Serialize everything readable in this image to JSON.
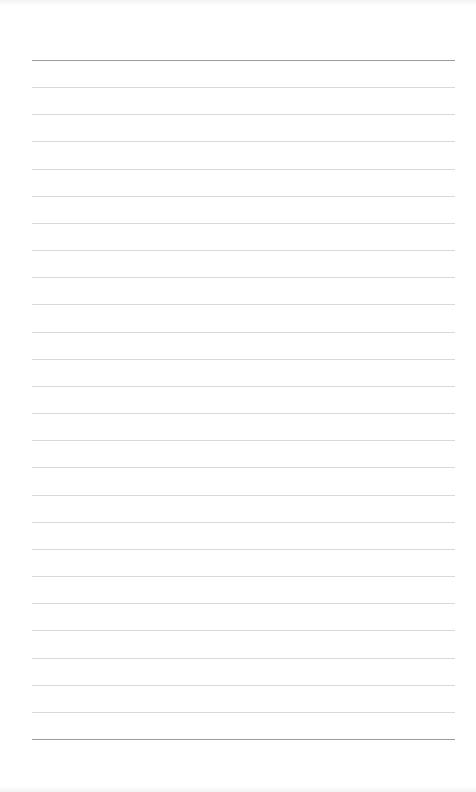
{
  "page": {
    "type": "lined-notebook-paper",
    "line_count": 26,
    "colors": {
      "background": "#ffffff",
      "edge_line": "#9c9c9c",
      "inner_line": "#d9d9d9"
    },
    "text": ""
  }
}
